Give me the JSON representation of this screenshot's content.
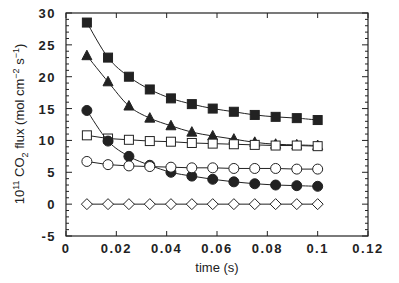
{
  "chart_data": {
    "type": "line",
    "title": "",
    "xlabel": "time (s)",
    "ylabel": "10^11 CO2 flux (mol cm^-2 s^-1)",
    "ylabel_parts": {
      "coef": "10",
      "coef_sup": "11",
      "species": "CO",
      "species_sub": "2",
      "rest": " flux (mol cm",
      "cm_sup": "−2",
      "s": " s",
      "s_sup": "−1",
      "close": ")"
    },
    "xlim": [
      0,
      0.12
    ],
    "ylim": [
      -5,
      30
    ],
    "xticks": [
      0,
      0.02,
      0.04,
      0.06,
      0.08,
      0.1,
      0.12
    ],
    "xtick_labels": [
      "0",
      "0.02",
      "0.04",
      "0.06",
      "0.08",
      "0.1",
      "0.12"
    ],
    "yticks": [
      -5,
      0,
      5,
      10,
      15,
      20,
      25,
      30
    ],
    "ytick_labels": [
      "-5",
      "0",
      "5",
      "10",
      "15",
      "20",
      "25",
      "30"
    ],
    "grid": false,
    "legend": null,
    "x": [
      0.0083,
      0.0167,
      0.025,
      0.0333,
      0.0417,
      0.05,
      0.0583,
      0.0667,
      0.075,
      0.0833,
      0.0917,
      0.1
    ],
    "series": [
      {
        "name": "filled-square",
        "marker": "square",
        "filled": true,
        "smooth": true,
        "values": [
          28.5,
          23.0,
          20.0,
          18.0,
          16.6,
          15.7,
          15.0,
          14.5,
          14.0,
          13.7,
          13.5,
          13.2
        ]
      },
      {
        "name": "filled-triangle",
        "marker": "triangle",
        "filled": true,
        "smooth": true,
        "values": [
          23.3,
          19.2,
          15.4,
          13.5,
          12.3,
          11.3,
          10.7,
          10.2,
          9.7,
          9.4,
          9.3,
          9.2
        ]
      },
      {
        "name": "open-square",
        "marker": "square",
        "filled": false,
        "smooth": false,
        "values": [
          10.8,
          10.3,
          10.1,
          9.9,
          9.8,
          9.6,
          9.5,
          9.4,
          9.3,
          9.2,
          9.2,
          9.1
        ]
      },
      {
        "name": "filled-circle",
        "marker": "circle",
        "filled": true,
        "smooth": true,
        "values": [
          14.7,
          9.9,
          7.5,
          6.1,
          5.0,
          4.4,
          3.9,
          3.5,
          3.2,
          3.0,
          2.9,
          2.8
        ]
      },
      {
        "name": "open-circle",
        "marker": "circle",
        "filled": false,
        "smooth": false,
        "values": [
          6.7,
          6.2,
          6.0,
          5.9,
          5.8,
          5.7,
          5.7,
          5.6,
          5.6,
          5.6,
          5.5,
          5.5
        ]
      },
      {
        "name": "open-diamond",
        "marker": "diamond",
        "filled": false,
        "smooth": false,
        "values": [
          0,
          0,
          0,
          0,
          0,
          0,
          0,
          0,
          0,
          0,
          0,
          0
        ]
      }
    ]
  },
  "colors": {
    "ink": "#222222",
    "background": "#ffffff"
  }
}
